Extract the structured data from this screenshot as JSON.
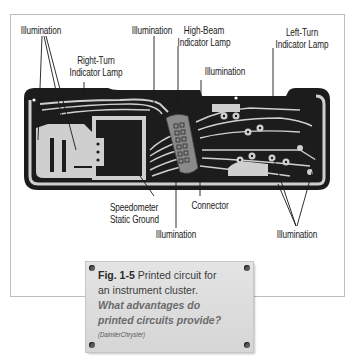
{
  "figure": {
    "labels": {
      "illumination_top_left": "Illumination",
      "right_turn": [
        "Right-Turn",
        "Indicator Lamp"
      ],
      "illumination_top_mid": "Illumination",
      "high_beam": [
        "High-Beam",
        "Indicator Lamp"
      ],
      "illumination_top_center": "Illumination",
      "left_turn": [
        "Left-Turn",
        "Indicator Lamp"
      ],
      "speedometer": [
        "Speedometer",
        "Static Ground"
      ],
      "connector": "Connector",
      "illumination_bottom_mid": "Illumination",
      "illumination_bottom_right": "Illumination"
    },
    "colors": {
      "board_dark": "#1c1c1c",
      "trace_light": "#cfcfcf",
      "frame_border": "#bdbdbd",
      "plate_bg": "#dcdcdc",
      "question_text": "#6a6a6a"
    }
  },
  "caption": {
    "fig_number": "Fig. 1-5",
    "text_1": " Printed circuit for",
    "text_2": "an instrument cluster.",
    "question_1": "What advantages do",
    "question_2": "printed circuits provide?",
    "credit": "(DaimlerChrysler)"
  }
}
